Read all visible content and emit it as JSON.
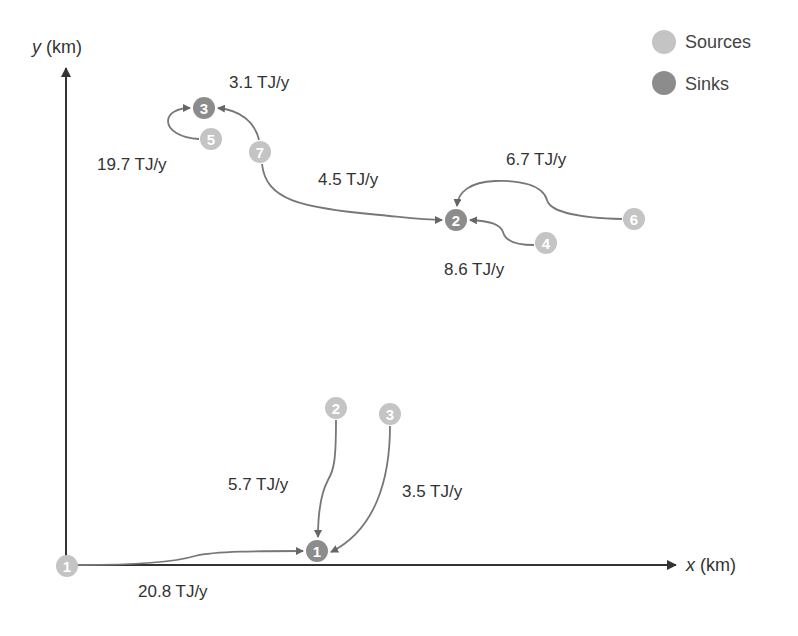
{
  "axes": {
    "x_label_var": "x",
    "x_label_unit": " (km)",
    "y_label_var": "y",
    "y_label_unit": " (km)"
  },
  "legend": {
    "items": [
      {
        "label": "Sources",
        "color": "#c4c4c4"
      },
      {
        "label": "Sinks",
        "color": "#8c8c8c"
      }
    ]
  },
  "colors": {
    "source": "#c4c4c4",
    "sink": "#8c8c8c",
    "axis": "#333333",
    "edge": "#777777"
  },
  "nodes": {
    "sources": [
      {
        "id": "1",
        "x": 67,
        "y": 566
      },
      {
        "id": "2",
        "x": 336,
        "y": 408
      },
      {
        "id": "3",
        "x": 390,
        "y": 414
      },
      {
        "id": "4",
        "x": 546,
        "y": 243
      },
      {
        "id": "5",
        "x": 211,
        "y": 139
      },
      {
        "id": "6",
        "x": 634,
        "y": 219
      },
      {
        "id": "7",
        "x": 260,
        "y": 152
      }
    ],
    "sinks": [
      {
        "id": "1",
        "x": 317,
        "y": 551
      },
      {
        "id": "2",
        "x": 456,
        "y": 220
      },
      {
        "id": "3",
        "x": 204,
        "y": 108
      }
    ]
  },
  "flows": [
    {
      "from": "source-1",
      "to": "sink-1",
      "label": "20.8 TJ/y"
    },
    {
      "from": "source-2",
      "to": "sink-1",
      "label": "5.7 TJ/y"
    },
    {
      "from": "source-3",
      "to": "sink-1",
      "label": "3.5 TJ/y"
    },
    {
      "from": "source-7",
      "to": "sink-2",
      "label": "4.5 TJ/y"
    },
    {
      "from": "source-6",
      "to": "sink-2",
      "label": "6.7 TJ/y"
    },
    {
      "from": "source-4",
      "to": "sink-2",
      "label": "8.6 TJ/y"
    },
    {
      "from": "source-5",
      "to": "sink-3",
      "label": "19.7 TJ/y"
    },
    {
      "from": "source-7",
      "to": "sink-3",
      "label": "3.1 TJ/y"
    }
  ]
}
